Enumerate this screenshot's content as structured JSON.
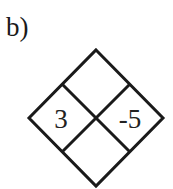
{
  "problem_label": "b)",
  "diagram": {
    "type": "diamond-problem",
    "cells": {
      "top": "",
      "left": "3",
      "right": "-5",
      "bottom": ""
    }
  }
}
